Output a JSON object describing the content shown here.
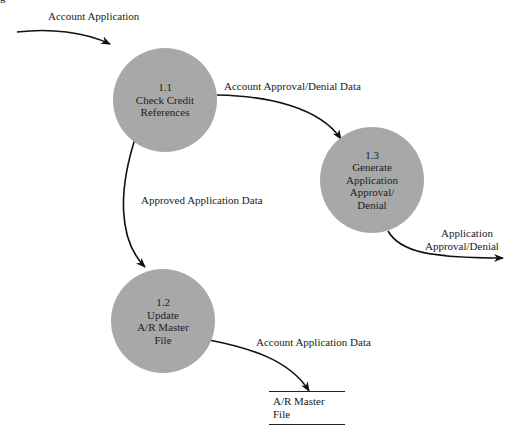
{
  "figure": {
    "corner_fragment": "g",
    "processes": [
      {
        "id": "1.1",
        "lines": [
          "1.1",
          "Check Credit",
          "References"
        ]
      },
      {
        "id": "1.2",
        "lines": [
          "1.2",
          "Update",
          "A/R Master",
          "File"
        ]
      },
      {
        "id": "1.3",
        "lines": [
          "1.3",
          "Generate",
          "Application",
          "Approval/",
          "Denial"
        ]
      }
    ],
    "data_store": {
      "label": "A/R Master File"
    },
    "flows": [
      {
        "label": "Account Application",
        "from": "external",
        "to": "1.1"
      },
      {
        "label": "Account Approval/Denial Data",
        "from": "1.1",
        "to": "1.3"
      },
      {
        "label": "Approved Application Data",
        "from": "1.1",
        "to": "1.2"
      },
      {
        "label_lines": [
          "Application",
          "Approval/Denial"
        ],
        "from": "1.3",
        "to": "external"
      },
      {
        "label": "Account Application Data",
        "from": "1.2",
        "to": "A/R Master File"
      }
    ],
    "colors": {
      "process_fill": "#a8a8a8",
      "line": "#111111",
      "background": "#ffffff"
    }
  }
}
